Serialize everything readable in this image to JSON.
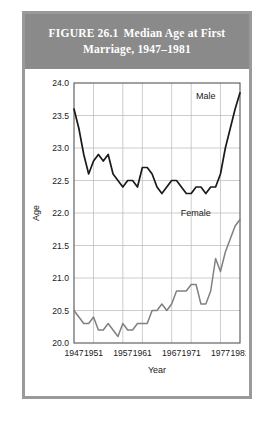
{
  "figure": {
    "number": "FIGURE 26.1",
    "title_line1": "Median Age at First",
    "title_line2": "Marriage, 1947–1981"
  },
  "chart_data": {
    "type": "line",
    "xlabel": "Year",
    "ylabel": "Age",
    "xlim": [
      1947,
      1981
    ],
    "ylim": [
      20.0,
      24.0
    ],
    "grid": true,
    "legend_position": "inline-right",
    "xticks": [
      1947,
      1951,
      1957,
      1961,
      1967,
      1971,
      1977,
      1981
    ],
    "xtick_labels": [
      "1947",
      "1951",
      "1957",
      "1961",
      "1967",
      "1971",
      "1977",
      "1981"
    ],
    "yticks": [
      20.0,
      20.5,
      21.0,
      21.5,
      22.0,
      22.5,
      23.0,
      23.5,
      24.0
    ],
    "ytick_labels": [
      "20.0",
      "20.5",
      "21.0",
      "21.5",
      "22.0",
      "22.5",
      "23.0",
      "23.5",
      "24.0"
    ],
    "x": [
      1947,
      1948,
      1949,
      1950,
      1951,
      1952,
      1953,
      1954,
      1955,
      1956,
      1957,
      1958,
      1959,
      1960,
      1961,
      1962,
      1963,
      1964,
      1965,
      1966,
      1967,
      1968,
      1969,
      1970,
      1971,
      1972,
      1973,
      1974,
      1975,
      1976,
      1977,
      1978,
      1979,
      1980,
      1981
    ],
    "series": [
      {
        "name": "Male",
        "color": "#1a1a1a",
        "label": "Male",
        "values": [
          23.6,
          23.3,
          22.9,
          22.6,
          22.8,
          22.9,
          22.8,
          22.9,
          22.6,
          22.5,
          22.4,
          22.5,
          22.5,
          22.4,
          22.7,
          22.7,
          22.6,
          22.4,
          22.3,
          22.4,
          22.5,
          22.5,
          22.4,
          22.3,
          22.3,
          22.4,
          22.4,
          22.3,
          22.4,
          22.4,
          22.6,
          23.0,
          23.3,
          23.6,
          23.85
        ]
      },
      {
        "name": "Female",
        "color": "#808080",
        "label": "Female",
        "values": [
          20.5,
          20.4,
          20.3,
          20.3,
          20.4,
          20.2,
          20.2,
          20.3,
          20.2,
          20.1,
          20.3,
          20.2,
          20.2,
          20.3,
          20.3,
          20.3,
          20.5,
          20.5,
          20.6,
          20.5,
          20.6,
          20.8,
          20.8,
          20.8,
          20.9,
          20.9,
          20.6,
          20.6,
          20.8,
          21.3,
          21.1,
          21.4,
          21.6,
          21.8,
          21.9
        ]
      }
    ],
    "annotations": [
      {
        "text": "Male",
        "x": 1976,
        "y": 23.75
      },
      {
        "text": "Female",
        "x": 1975,
        "y": 21.95
      }
    ]
  }
}
